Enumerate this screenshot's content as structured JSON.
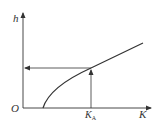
{
  "diagram": {
    "axes": {
      "y_label": "h",
      "x_label": "K",
      "origin_label": "O"
    },
    "marker": {
      "label_main": "K",
      "label_sub": "A"
    },
    "curve": {
      "description": "concave increasing curve starting on K-axis, rising to upper right",
      "start": [
        43,
        108
      ],
      "through": [
        91,
        68
      ],
      "end": [
        143,
        43
      ]
    },
    "guide_lines": {
      "vertical": "arrow up from K_A to curve",
      "horizontal": "arrow left from curve to h-axis"
    },
    "colors": {
      "line": "#333333",
      "background": "#ffffff"
    }
  }
}
